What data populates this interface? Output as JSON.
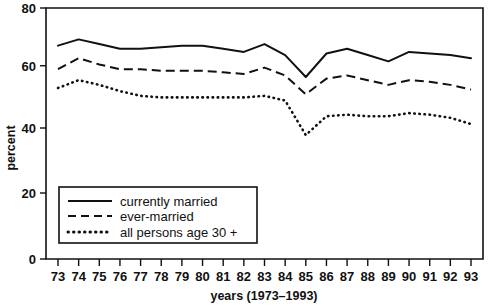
{
  "chart_data": {
    "type": "line",
    "title": "",
    "xlabel": "years (1973–1993)",
    "ylabel": "percent",
    "ylim": [
      0,
      80
    ],
    "yticks": [
      0,
      20,
      40,
      60,
      80
    ],
    "grid": false,
    "legend_position": "lower-left-inside",
    "x": [
      1973,
      1974,
      1975,
      1976,
      1977,
      1978,
      1979,
      1980,
      1981,
      1982,
      1983,
      1984,
      1985,
      1986,
      1987,
      1988,
      1989,
      1990,
      1991,
      1992,
      1993
    ],
    "categories": [
      "73",
      "74",
      "75",
      "76",
      "77",
      "78",
      "79",
      "80",
      "81",
      "82",
      "83",
      "84",
      "85",
      "86",
      "87",
      "88",
      "89",
      "90",
      "91",
      "92",
      "93"
    ],
    "series": [
      {
        "name": "currently married",
        "style": "solid",
        "values": [
          68.0,
          70.0,
          68.5,
          67.0,
          67.0,
          67.5,
          68.0,
          68.0,
          67.0,
          66.0,
          68.5,
          65.0,
          58.0,
          65.5,
          67.0,
          65.0,
          63.0,
          66.0,
          65.5,
          65.0,
          64.0
        ]
      },
      {
        "name": "ever-married",
        "style": "dashed",
        "values": [
          60.5,
          64.0,
          62.0,
          60.5,
          60.5,
          60.0,
          60.0,
          60.0,
          59.5,
          59.0,
          61.0,
          58.5,
          52.5,
          57.5,
          58.5,
          57.0,
          55.5,
          57.0,
          56.5,
          55.5,
          54.0
        ]
      },
      {
        "name": "all persons age 30 +",
        "style": "dotted",
        "values": [
          54.5,
          57.0,
          55.5,
          53.5,
          52.0,
          51.5,
          51.5,
          51.5,
          51.5,
          51.5,
          52.0,
          50.5,
          39.5,
          45.5,
          46.0,
          45.5,
          45.5,
          46.5,
          46.0,
          45.0,
          43.0
        ]
      }
    ]
  },
  "axes": {
    "y_label": "percent",
    "x_label": "years (1973–1993)",
    "y_tick_labels": [
      "0",
      "20",
      "40",
      "60",
      "80"
    ],
    "x_tick_labels": [
      "73",
      "74",
      "75",
      "76",
      "77",
      "78",
      "79",
      "80",
      "81",
      "82",
      "83",
      "84",
      "85",
      "86",
      "87",
      "88",
      "89",
      "90",
      "91",
      "92",
      "93"
    ]
  },
  "legend": {
    "items": [
      {
        "label": "currently married",
        "style": "solid"
      },
      {
        "label": "ever-married",
        "style": "dashed"
      },
      {
        "label": "all persons age 30 +",
        "style": "dotted"
      }
    ]
  },
  "colors": {
    "ink": "#111111",
    "background": "#ffffff"
  }
}
